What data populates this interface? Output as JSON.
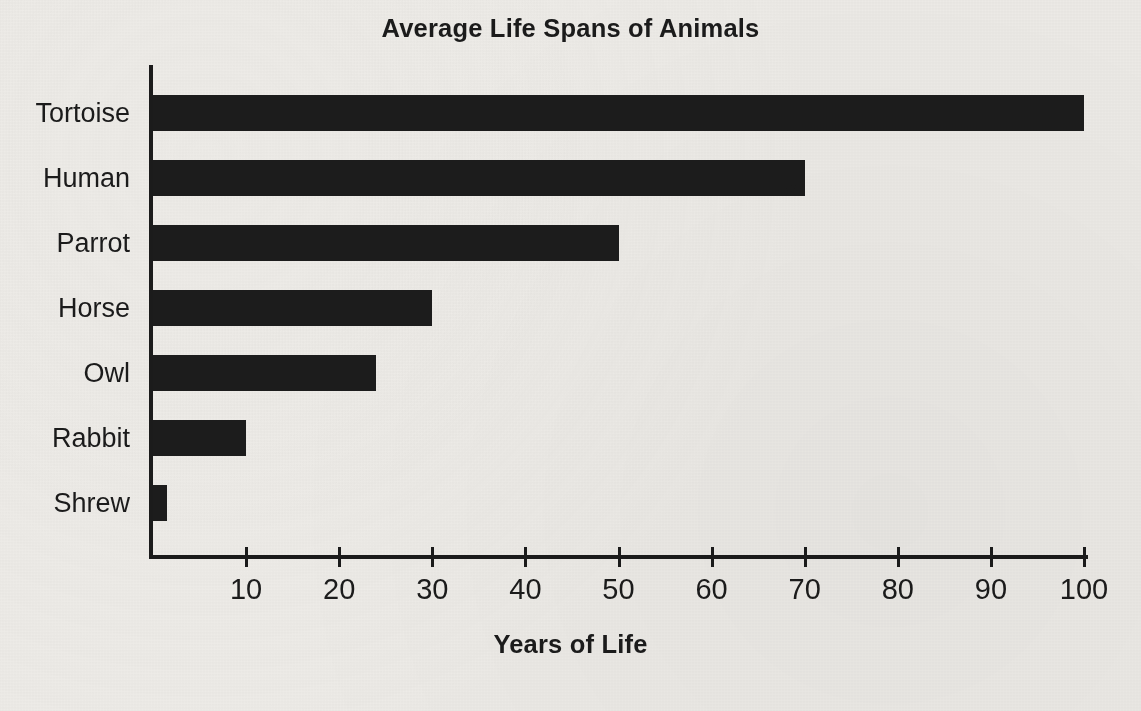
{
  "chart_data": {
    "type": "bar",
    "orientation": "horizontal",
    "title": "Average Life Spans of Animals",
    "xlabel": "Years of Life",
    "ylabel": "",
    "categories": [
      "Tortoise",
      "Human",
      "Parrot",
      "Horse",
      "Owl",
      "Rabbit",
      "Shrew"
    ],
    "values": [
      100,
      70,
      50,
      30,
      24,
      10,
      1.5
    ],
    "xlim": [
      0,
      101
    ],
    "ylim": null,
    "xticks": [
      10,
      20,
      30,
      40,
      50,
      60,
      70,
      80,
      90,
      100
    ],
    "xtick_labels": [
      "10",
      "20",
      "30",
      "40",
      "50",
      "60",
      "70",
      "80",
      "90",
      "100"
    ],
    "grid": false,
    "legend": null,
    "bar_color": "#1c1c1c",
    "background_color": "#edebe7",
    "axis_color": "#1b1b1b",
    "text_color": "#1b1b1b"
  }
}
